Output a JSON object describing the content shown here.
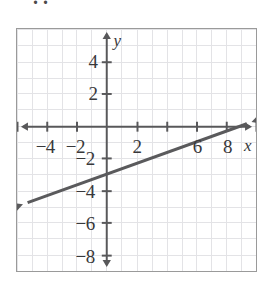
{
  "page": {
    "partial_top_glyph": "..",
    "background_color": "#ffffff",
    "border_color": "#9a9a9a"
  },
  "chart_data": {
    "type": "line",
    "title": "",
    "subtitle": "",
    "xlabel": "x",
    "ylabel": "y",
    "xlim": [
      -6,
      10
    ],
    "ylim": [
      -9,
      6
    ],
    "grid": true,
    "grid_step": 1,
    "tick_step": 2,
    "legend": null,
    "legend_position": "none",
    "axis_arrows": "both",
    "xticks": [
      -6,
      -4,
      -2,
      0,
      2,
      4,
      6,
      8,
      10
    ],
    "yticks": [
      -8,
      -6,
      -4,
      -2,
      0,
      2,
      4
    ],
    "xtick_labels": [
      {
        "value": -4,
        "text": "−4"
      },
      {
        "value": -2,
        "text": "−2"
      },
      {
        "value": 2,
        "text": "2"
      },
      {
        "value": 6,
        "text": "6"
      },
      {
        "value": 8,
        "text": "8"
      }
    ],
    "ytick_labels": [
      {
        "value": 4,
        "text": "4"
      },
      {
        "value": 2,
        "text": "2"
      },
      {
        "value": -2,
        "text": "−2"
      },
      {
        "value": -4,
        "text": "−4"
      },
      {
        "value": -6,
        "text": "−6"
      },
      {
        "value": -8,
        "text": "−8"
      }
    ],
    "series": [
      {
        "name": "line",
        "type": "line",
        "slope": 0.3333,
        "y_intercept": -3,
        "x_intercept": 9,
        "equation": "y = (1/3)x - 3",
        "color": "#5a5a5c",
        "width": 3,
        "arrows": "both",
        "points": [
          {
            "x": -5.6,
            "y": -4.87
          },
          {
            "x": 0,
            "y": -3
          },
          {
            "x": 9,
            "y": 0
          },
          {
            "x": 9.7,
            "y": 0.23
          }
        ]
      }
    ],
    "colors": {
      "grid": "#e3e3e6",
      "axis": "#58585a",
      "line": "#5a5a5c",
      "text": "#38383a",
      "frame": "#9a9a9a"
    }
  }
}
